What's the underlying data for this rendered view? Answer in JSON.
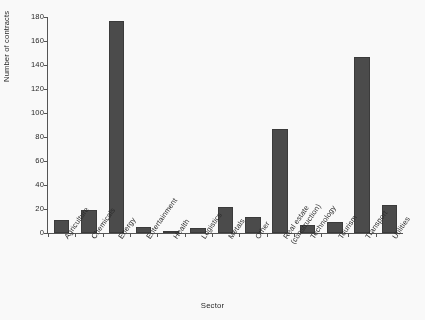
{
  "chart_data": {
    "type": "bar",
    "title": "",
    "xlabel": "Sector",
    "ylabel": "Number of contracts",
    "categories": [
      "Agriculture",
      "Chemicals",
      "Energy",
      "Entertainment",
      "Health",
      "Logistics",
      "Metals",
      "Other",
      "Real estate (construction)",
      "Technology",
      "Tourism",
      "Transport",
      "Utilities"
    ],
    "category_lines": [
      [
        "Agriculture"
      ],
      [
        "Chemicals"
      ],
      [
        "Energy"
      ],
      [
        "Entertainment"
      ],
      [
        "Health"
      ],
      [
        "Logistics"
      ],
      [
        "Metals"
      ],
      [
        "Other"
      ],
      [
        "Real estate",
        "(construction)"
      ],
      [
        "Technology"
      ],
      [
        "Tourism"
      ],
      [
        "Transport"
      ],
      [
        "Utilities"
      ]
    ],
    "values": [
      11,
      19,
      177,
      5,
      2,
      4,
      22,
      13,
      87,
      7,
      9,
      147,
      23
    ],
    "ylim": [
      0,
      180
    ],
    "ytick_values": [
      0,
      20,
      40,
      60,
      80,
      100,
      120,
      140,
      160,
      180
    ],
    "ytick_labels": [
      "0",
      "20",
      "40",
      "60",
      "80",
      "100",
      "120",
      "140",
      "160",
      "180"
    ],
    "grid": false,
    "legend": false,
    "bar_color": "#4a4a4a",
    "axis_color": "#555555",
    "background_color": "#ffffff"
  }
}
